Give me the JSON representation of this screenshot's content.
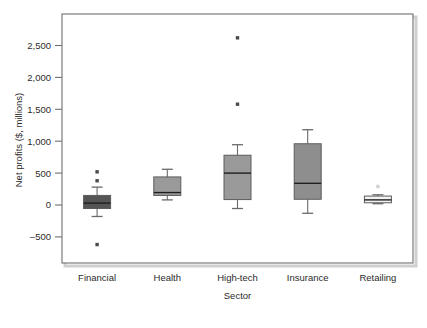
{
  "chart_data": {
    "type": "box",
    "title": "",
    "xlabel": "Sector",
    "ylabel": "Net profits ($, millions)",
    "categories": [
      "Financial",
      "Health",
      "High-tech",
      "Insurance",
      "Retailing"
    ],
    "ylim": [
      -780,
      2780
    ],
    "yticks": [
      -500,
      0,
      500,
      1000,
      1500,
      2000,
      2500
    ],
    "ytick_labels": [
      "–500",
      "0",
      "500",
      "1,000",
      "1,500",
      "2,000",
      "2,500"
    ],
    "grid": false,
    "legend": "none",
    "boxes": [
      {
        "category": "Financial",
        "whisker_low": -180,
        "q1": -55,
        "median": 30,
        "q3": 150,
        "whisker_high": 280,
        "outliers": [
          520,
          380,
          -620
        ],
        "fill": "#555555"
      },
      {
        "category": "Health",
        "whisker_low": 80,
        "q1": 150,
        "median": 195,
        "q3": 440,
        "whisker_high": 560,
        "outliers": [],
        "fill": "#9a9a9a"
      },
      {
        "category": "High-tech",
        "whisker_low": -55,
        "q1": 85,
        "median": 500,
        "q3": 780,
        "whisker_high": 945,
        "outliers": [
          2620,
          1580
        ],
        "fill": "#9a9a9a"
      },
      {
        "category": "Insurance",
        "whisker_low": -130,
        "q1": 90,
        "median": 340,
        "q3": 960,
        "whisker_high": 1180,
        "outliers": [],
        "fill": "#8e8e8e"
      },
      {
        "category": "Retailing",
        "whisker_low": 20,
        "q1": 35,
        "median": 80,
        "q3": 140,
        "whisker_high": 160,
        "outliers": [
          290
        ],
        "fill": "#f2f2f2"
      }
    ]
  },
  "colors": {
    "frame": "#6f6f6f",
    "text": "#2b2b2b",
    "outlier": "#4a4a4a",
    "background": "#ffffff"
  }
}
